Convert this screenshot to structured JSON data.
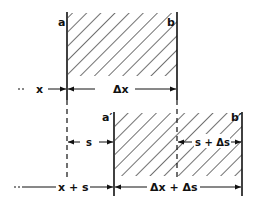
{
  "figure": {
    "top_element": {
      "left_label": "a",
      "right_label": "b",
      "width_label": "Δx",
      "position_label": "x"
    },
    "bottom_element": {
      "left_label": "a′",
      "right_label": "b′",
      "width_label": "Δx + Δs",
      "position_label": "x + s",
      "shift_left_label": "s",
      "shift_right_label": "s + Δs"
    },
    "colors": {
      "ink": "#111111",
      "background": "#ffffff"
    }
  }
}
